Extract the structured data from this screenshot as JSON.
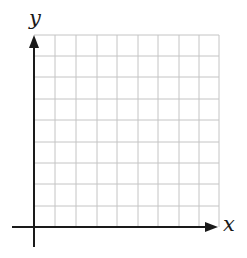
{
  "diagram": {
    "type": "coordinate-grid",
    "x_axis_label": "x",
    "y_axis_label": "y",
    "grid_columns": 9,
    "grid_rows": 9,
    "colors": {
      "axis": "#1a1a1a",
      "grid": "#bdbdbd",
      "background": "#ffffff"
    }
  }
}
